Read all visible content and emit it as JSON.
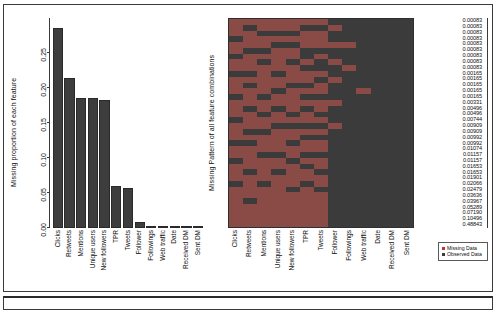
{
  "figure": {
    "title": "",
    "background": "#ffffff",
    "border_color": "#3a3a3a"
  },
  "colors": {
    "bar_fill": "#3d3d3d",
    "observed": "#3b3b3b",
    "missing": "#b03a36",
    "axis": "#3a3a3a",
    "text": "#101010"
  },
  "legend": {
    "items": [
      {
        "label": "Missing Data",
        "color": "#b03a36",
        "swatch_class": "sw-missing"
      },
      {
        "label": "Observed Data",
        "color": "#3b3b3b",
        "swatch_class": "sw-observed"
      }
    ]
  },
  "chart_data": [
    {
      "type": "bar",
      "title": "",
      "ylabel": "Missing proportion of each feature",
      "xlabel": "",
      "ylim": [
        0,
        0.3
      ],
      "grid": false,
      "yticks": [
        "0.00",
        "0.05",
        "0.10",
        "0.15",
        "0.20",
        "0.25"
      ],
      "ytick_values": [
        0.0,
        0.05,
        0.1,
        0.15,
        0.2,
        0.25
      ],
      "categories": [
        "Clicks",
        "Retweets",
        "Mentions",
        "Unique users",
        "New followers",
        "TPR",
        "Tweets",
        "Follower",
        "Followings",
        "Web traffic",
        "Date",
        "Received DM",
        "Sent DM"
      ],
      "values": [
        0.286,
        0.215,
        0.186,
        0.186,
        0.183,
        0.06,
        0.057,
        0.009,
        0.003,
        0.001,
        0.0008,
        0.0008,
        0.0008
      ]
    },
    {
      "type": "heatmap",
      "title": "",
      "ylabel": "Missing Pattern of all feature combinations",
      "xlabel": "",
      "legend_position": "bottom-right",
      "categories": [
        "Clicks",
        "Retweets",
        "Mentions",
        "Unique users",
        "New followers",
        "TPR",
        "Tweets",
        "Follower",
        "Followings",
        "Web traffic",
        "Date",
        "Received DM",
        "Sent DM"
      ],
      "row_proportions": [
        "0.00083",
        "0.00083",
        "0.00083",
        "0.00083",
        "0.00083",
        "0.00083",
        "0.00083",
        "0.00083",
        "0.00083",
        "0.00165",
        "0.00165",
        "0.00165",
        "0.00165",
        "0.00165",
        "0.00331",
        "0.00496",
        "0.00496",
        "0.00744",
        "0.00909",
        "0.00909",
        "0.00992",
        "0.00992",
        "0.01074",
        "0.01157",
        "0.01157",
        "0.01653",
        "0.01653",
        "0.01901",
        "0.02066",
        "0.02479",
        "0.03636",
        "0.03967",
        "0.05289",
        "0.07190",
        "0.10496",
        "0.48843"
      ],
      "cell_states": [
        [
          1,
          1,
          1,
          1,
          1,
          1,
          1,
          0,
          0,
          0,
          0,
          0,
          0
        ],
        [
          1,
          0,
          1,
          1,
          1,
          0,
          0,
          1,
          0,
          0,
          0,
          0,
          0
        ],
        [
          1,
          1,
          0,
          0,
          0,
          1,
          1,
          0,
          0,
          0,
          0,
          0,
          0
        ],
        [
          0,
          1,
          1,
          1,
          1,
          1,
          1,
          0,
          0,
          0,
          0,
          0,
          0
        ],
        [
          1,
          1,
          1,
          0,
          0,
          1,
          1,
          1,
          1,
          0,
          0,
          0,
          0
        ],
        [
          1,
          0,
          0,
          1,
          1,
          0,
          0,
          0,
          0,
          0,
          0,
          0,
          0
        ],
        [
          0,
          1,
          1,
          1,
          1,
          0,
          1,
          0,
          0,
          0,
          0,
          0,
          0
        ],
        [
          1,
          1,
          0,
          1,
          0,
          1,
          0,
          1,
          0,
          0,
          0,
          0,
          0
        ],
        [
          1,
          1,
          1,
          1,
          1,
          0,
          0,
          0,
          1,
          0,
          0,
          0,
          0
        ],
        [
          0,
          0,
          1,
          0,
          1,
          1,
          1,
          0,
          0,
          0,
          0,
          0,
          0
        ],
        [
          1,
          1,
          1,
          1,
          1,
          1,
          0,
          1,
          0,
          0,
          0,
          0,
          0
        ],
        [
          1,
          0,
          1,
          1,
          0,
          0,
          1,
          0,
          0,
          0,
          0,
          0,
          0
        ],
        [
          1,
          1,
          1,
          0,
          1,
          1,
          1,
          0,
          0,
          1,
          0,
          0,
          0
        ],
        [
          0,
          1,
          0,
          1,
          1,
          0,
          0,
          0,
          0,
          0,
          0,
          0,
          0
        ],
        [
          1,
          1,
          1,
          1,
          1,
          1,
          1,
          1,
          0,
          0,
          0,
          0,
          0
        ],
        [
          1,
          0,
          1,
          0,
          1,
          0,
          1,
          0,
          0,
          0,
          0,
          0,
          0
        ],
        [
          1,
          1,
          0,
          1,
          0,
          1,
          0,
          0,
          0,
          0,
          0,
          0,
          0
        ],
        [
          0,
          1,
          1,
          1,
          1,
          1,
          1,
          0,
          0,
          0,
          0,
          0,
          0
        ],
        [
          1,
          1,
          1,
          0,
          0,
          0,
          0,
          1,
          0,
          0,
          0,
          0,
          0
        ],
        [
          1,
          0,
          0,
          1,
          1,
          1,
          1,
          0,
          0,
          0,
          0,
          0,
          0
        ],
        [
          1,
          1,
          1,
          1,
          1,
          0,
          0,
          0,
          0,
          0,
          0,
          0,
          0
        ],
        [
          0,
          0,
          1,
          1,
          0,
          1,
          1,
          0,
          0,
          0,
          0,
          0,
          0
        ],
        [
          1,
          1,
          1,
          1,
          1,
          1,
          1,
          0,
          0,
          0,
          0,
          0,
          0
        ],
        [
          1,
          1,
          0,
          0,
          1,
          0,
          0,
          0,
          0,
          0,
          0,
          0,
          0
        ],
        [
          0,
          1,
          1,
          1,
          0,
          1,
          1,
          0,
          0,
          0,
          0,
          0,
          0
        ],
        [
          1,
          1,
          1,
          1,
          1,
          0,
          1,
          0,
          0,
          0,
          0,
          0,
          0
        ],
        [
          1,
          0,
          1,
          0,
          1,
          1,
          0,
          0,
          0,
          0,
          0,
          0,
          0
        ],
        [
          1,
          1,
          1,
          1,
          1,
          1,
          1,
          0,
          0,
          0,
          0,
          0,
          0
        ],
        [
          0,
          1,
          0,
          1,
          1,
          0,
          1,
          0,
          0,
          0,
          0,
          0,
          0
        ],
        [
          1,
          1,
          1,
          1,
          0,
          1,
          0,
          0,
          0,
          0,
          0,
          0,
          0
        ],
        [
          1,
          1,
          1,
          1,
          1,
          1,
          1,
          0,
          0,
          0,
          0,
          0,
          0
        ],
        [
          1,
          0,
          1,
          1,
          1,
          1,
          1,
          0,
          0,
          0,
          0,
          0,
          0
        ],
        [
          1,
          1,
          1,
          1,
          1,
          1,
          1,
          0,
          0,
          0,
          0,
          0,
          0
        ],
        [
          1,
          1,
          1,
          1,
          1,
          1,
          1,
          0,
          0,
          0,
          0,
          0,
          0
        ],
        [
          1,
          1,
          1,
          1,
          1,
          1,
          1,
          0,
          0,
          0,
          0,
          0,
          0
        ],
        [
          1,
          1,
          1,
          1,
          1,
          1,
          1,
          0,
          0,
          0,
          0,
          0,
          0
        ]
      ]
    }
  ]
}
